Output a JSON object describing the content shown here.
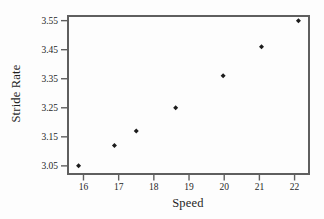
{
  "figure": {
    "title": "",
    "background_color": "#fdfdfd"
  },
  "chart_data": {
    "type": "scatter",
    "title": "",
    "xlabel": "Speed",
    "ylabel": "Stride Rate",
    "x": [
      15.86,
      16.88,
      17.5,
      18.62,
      19.97,
      21.06,
      22.11
    ],
    "y": [
      3.05,
      3.12,
      3.17,
      3.25,
      3.36,
      3.46,
      3.55
    ],
    "xticks": [
      {
        "value": 16,
        "label": "16"
      },
      {
        "value": 17,
        "label": "17"
      },
      {
        "value": 18,
        "label": "18"
      },
      {
        "value": 19,
        "label": "19"
      },
      {
        "value": 20,
        "label": "20"
      },
      {
        "value": 21,
        "label": "21"
      },
      {
        "value": 22,
        "label": "22"
      }
    ],
    "yticks": [
      {
        "value": 3.05,
        "label": "3.05"
      },
      {
        "value": 3.15,
        "label": "3.15"
      },
      {
        "value": 3.25,
        "label": "3.25"
      },
      {
        "value": 3.35,
        "label": "3.35"
      },
      {
        "value": 3.45,
        "label": "3.45"
      },
      {
        "value": 3.55,
        "label": "3.55"
      }
    ],
    "xlim": [
      15.56,
      22.41
    ],
    "ylim": [
      3.022,
      3.566
    ],
    "grid": false,
    "legend": null,
    "marker": "diamond",
    "colors": {
      "point": "#1c1c1c",
      "frame": "#5f5f5f",
      "tick": "#5f5f5f",
      "text": "#1f1f1f"
    }
  }
}
